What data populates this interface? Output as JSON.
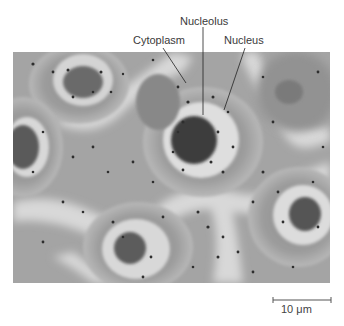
{
  "figure": {
    "labels": [
      {
        "id": "nucleolus",
        "text": "Nucleolus"
      },
      {
        "id": "cytoplasm",
        "text": "Cytoplasm"
      },
      {
        "id": "nucleus",
        "text": "Nucleus"
      }
    ],
    "scale_bar": {
      "text": "10 μm"
    },
    "image": {
      "description": "Phase-contrast micrograph of cells showing cytoplasm, nucleus and nucleolus"
    }
  }
}
